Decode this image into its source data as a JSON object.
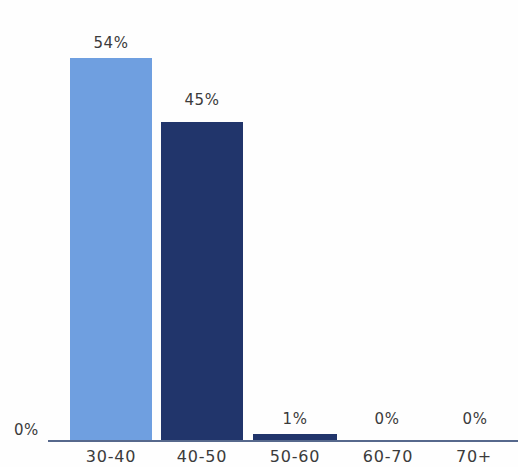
{
  "chart_data": {
    "type": "bar",
    "title": "",
    "subtitle": "",
    "xlabel": "",
    "ylabel": "",
    "categories": [
      "30-40",
      "40-50",
      "50-60",
      "60-70",
      "70+"
    ],
    "values": [
      54,
      45,
      1,
      0,
      0
    ],
    "data_labels": [
      "54%",
      "45%",
      "1%",
      "0%",
      "0%"
    ],
    "bar_colors": [
      "#6f9fe0",
      "#21356b",
      "#21356b",
      "#21356b",
      "#21356b"
    ],
    "ylim": [
      0,
      54
    ],
    "y_axis_tick_labels": [
      "0%"
    ],
    "grid": false,
    "legend": null,
    "axis_color": "#56688c",
    "label_color": "#3b3b3b",
    "background_color": "#fefefe"
  },
  "axis": {
    "zero_label": "0%"
  }
}
